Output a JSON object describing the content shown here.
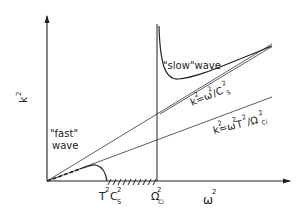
{
  "diagram": {
    "axes": {
      "y_label_base": "k",
      "y_label_sup": "2",
      "x_label_base": "ω",
      "x_label_sup": "2"
    },
    "x_ticks": {
      "tcs_T": "T",
      "tcs_T_sup": "2",
      "tcs_C": "C",
      "tcs_C_sup": "2",
      "tcs_C_sub": "S",
      "omega_ci": "Ω",
      "omega_ci_sup": "2",
      "omega_ci_sub": "Ci"
    },
    "curves": {
      "slow_wave_label": "\"slow\"wave",
      "fast_wave_label_1": "\"fast\"",
      "fast_wave_label_2": "wave"
    },
    "asymptotes": {
      "upper": "k²=ω²/C²s",
      "upper_parts": {
        "k": "k",
        "k_sup": "2",
        "eq": "=ω",
        "w_sup": "2",
        "div": "/C",
        "c_sup": "2",
        "c_sub": "S"
      },
      "lower": "k²=ω²T²/Ω²ci",
      "lower_parts": {
        "k": "k",
        "k_sup": "2",
        "eq": "=ω",
        "w_sup": "2",
        "t": "T",
        "t_sup": "2",
        "div": "/Ω",
        "o_sup": "2",
        "o_sub": "Ci"
      }
    },
    "colors": {
      "ink": "#222222",
      "background": "#ffffff"
    }
  }
}
